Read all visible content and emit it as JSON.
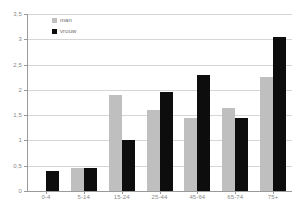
{
  "chart_data": {
    "type": "bar",
    "title": "",
    "subtitle": "",
    "xlabel": "",
    "ylabel": "",
    "categories": [
      "0-4",
      "5-14",
      "15-24",
      "25-44",
      "45-64",
      "65-74",
      "75+"
    ],
    "series": [
      {
        "name": "man",
        "color": "#bfbfbf",
        "values": [
          0.0,
          0.45,
          1.9,
          1.6,
          1.45,
          1.65,
          2.25
        ]
      },
      {
        "name": "vrouw",
        "color": "#0d0d0d",
        "values": [
          0.4,
          0.45,
          1.0,
          1.95,
          2.3,
          1.45,
          3.05
        ]
      }
    ],
    "ylim": [
      0,
      3.5
    ],
    "ytick_values": [
      0,
      0.5,
      1,
      1.5,
      2,
      2.5,
      3,
      3.5
    ],
    "ytick_labels": [
      "0",
      "0,5",
      "1",
      "1,5",
      "2",
      "2,5",
      "3",
      "3,5"
    ],
    "grid": true,
    "legend_position": "top-left",
    "legend": [
      {
        "label": "man",
        "color": "#bfbfbf"
      },
      {
        "label": "vrouw",
        "color": "#0d0d0d"
      }
    ]
  },
  "colors": {
    "series_man": "#bfbfbf",
    "series_vrouw": "#0d0d0d",
    "gridline": "#d6d6d6",
    "axis": "#9a9a9a",
    "tick_text": "#8a8a8a",
    "legend_text": "#6e6e6e",
    "background": "#ffffff"
  }
}
